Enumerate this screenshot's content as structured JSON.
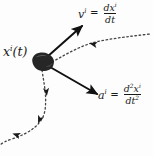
{
  "figure": {
    "background_color": "#fdfdfd",
    "ink_color": "#1a1a1a",
    "width": 153,
    "height": 156
  },
  "labels": {
    "position": {
      "name": "position-label",
      "symbol": "x",
      "index": "i",
      "argument": "(t)",
      "full_text": "x i(t)"
    },
    "velocity": {
      "name": "velocity-label",
      "symbol": "v",
      "index": "i",
      "equals": "=",
      "numerator_d": "d",
      "numerator_symbol": "x",
      "numerator_index": "i",
      "denominator": "dt",
      "full_text": "v i = dx i/dt"
    },
    "acceleration": {
      "name": "acceleration-label",
      "symbol": "a",
      "index": "i",
      "equals": "=",
      "numerator_d": "d",
      "numerator_order": "2",
      "numerator_symbol": "x",
      "numerator_index": "i",
      "denominator_dt": "dt",
      "denominator_order": "2",
      "full_text": "a i = d2x i/dt2"
    }
  },
  "geometry": {
    "particle": {
      "name": "particle-blob",
      "center_x": 42,
      "center_y": 62,
      "radius_x": 11,
      "radius_y": 8,
      "fill": "#262626"
    },
    "velocity_arrow": {
      "name": "velocity-vector-arrow",
      "from": [
        47,
        57
      ],
      "to": [
        84,
        24
      ],
      "color": "#111111",
      "width": 2
    },
    "acceleration_arrow": {
      "name": "acceleration-vector-arrow",
      "from": [
        50,
        67
      ],
      "to": [
        99,
        96
      ],
      "color": "#111111",
      "width": 2
    },
    "trajectory": {
      "name": "dotted-trajectory-path",
      "style": "dotted",
      "color": "#444444",
      "dash": "1.6 2.6",
      "upper_segment": "M 52 62 C 70 52 84 44 100 41 C 116 38 132 36 150 34",
      "lower_segment": "M 42 70 C 44 84 47 96 45 110 C 43 124 30 133 12 139 C 6 141 2 143 0 145",
      "arrowheads": [
        {
          "name": "trajectory-arrowhead-upper",
          "x": 95,
          "y": 42,
          "angle": 190
        },
        {
          "name": "trajectory-arrowhead-mid",
          "x": 45,
          "y": 92,
          "angle": 272
        },
        {
          "name": "trajectory-arrowhead-lower",
          "x": 44,
          "y": 120,
          "angle": 290
        },
        {
          "name": "trajectory-arrowhead-tail",
          "x": 16,
          "y": 138,
          "angle": 340
        }
      ]
    }
  }
}
